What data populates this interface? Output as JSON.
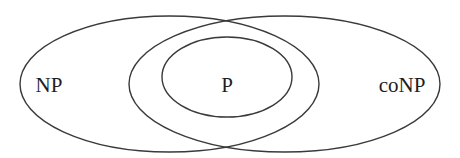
{
  "diagram": {
    "type": "venn",
    "title": "",
    "colors": {
      "stroke": "#3a3a3a",
      "text": "#1e1e1e",
      "background": "#ffffff"
    },
    "sets": [
      {
        "id": "np",
        "label": "NP",
        "cx": 169.5,
        "cy": 84,
        "rx": 149.5,
        "ry": 68,
        "label_x": 49,
        "label_y": 92
      },
      {
        "id": "conp",
        "label": "coNP",
        "cx": 284.5,
        "cy": 84,
        "rx": 155.5,
        "ry": 68,
        "label_x": 402,
        "label_y": 92
      },
      {
        "id": "p",
        "label": "P",
        "cx": 227,
        "cy": 77,
        "rx": 65,
        "ry": 40,
        "label_x": 227,
        "label_y": 92
      }
    ],
    "relations": [
      "P ⊆ NP ∩ coNP"
    ]
  }
}
